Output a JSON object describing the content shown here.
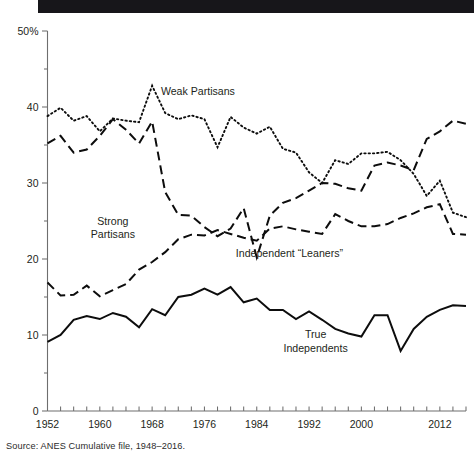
{
  "figure": {
    "top_band_label": "black-header-band",
    "source": "Source: ANES Cumulative file, 1948–2016."
  },
  "chart_data": {
    "type": "line",
    "title": "",
    "subtitle": "",
    "xlabel": "",
    "ylabel": "",
    "xlim": [
      1952,
      2016
    ],
    "ylim": [
      0,
      50
    ],
    "grid": false,
    "legend_position": "inline-annotations",
    "y_ticks": [
      0,
      10,
      20,
      30,
      40,
      50
    ],
    "y_tick_labels": [
      "0",
      "10",
      "20",
      "30",
      "40",
      "50%"
    ],
    "y_minor_ticks": [
      5,
      15,
      25,
      35,
      45
    ],
    "x_ticks": [
      1952,
      1954,
      1956,
      1958,
      1960,
      1962,
      1964,
      1966,
      1968,
      1970,
      1972,
      1974,
      1976,
      1978,
      1980,
      1982,
      1984,
      1986,
      1988,
      1990,
      1992,
      1994,
      1996,
      1998,
      2000,
      2002,
      2004,
      2006,
      2008,
      2010,
      2012,
      2014,
      2016
    ],
    "x_tick_labels": [
      "1952",
      "1960",
      "1968",
      "1976",
      "1984",
      "1992",
      "2000",
      "2012"
    ],
    "x_labeled_ticks": [
      1952,
      1960,
      1968,
      1976,
      1984,
      1992,
      2000,
      2012
    ],
    "x": [
      1952,
      1954,
      1956,
      1958,
      1960,
      1962,
      1964,
      1966,
      1968,
      1970,
      1972,
      1974,
      1976,
      1978,
      1980,
      1982,
      1984,
      1986,
      1988,
      1990,
      1992,
      1994,
      1996,
      1998,
      2000,
      2002,
      2004,
      2006,
      2008,
      2010,
      2012,
      2014,
      2016
    ],
    "series": [
      {
        "name": "Weak Partisans",
        "style": "dotted",
        "label_x": 1975,
        "label_y": 41.6,
        "values": [
          38.8,
          39.9,
          38.2,
          38.8,
          36.8,
          38.5,
          38.2,
          38.0,
          42.8,
          39.2,
          38.4,
          38.9,
          38.4,
          34.7,
          38.7,
          37.3,
          36.5,
          37.4,
          34.5,
          34.0,
          31.4,
          30.0,
          33.0,
          32.5,
          33.9,
          33.9,
          34.1,
          33.0,
          31.2,
          28.3,
          30.3,
          26.1,
          25.5
        ]
      },
      {
        "name": "Strong Partisans",
        "style": "dashed",
        "label_x": 1962,
        "label_y": 24.5,
        "label_lines": [
          "Strong",
          "Partisans"
        ],
        "values": [
          35.2,
          36.2,
          34.0,
          34.4,
          36.2,
          38.4,
          37.0,
          35.2,
          38.1,
          28.8,
          25.8,
          25.7,
          24.2,
          23.0,
          24.0,
          26.7,
          20.2,
          25.7,
          27.4,
          28.0,
          29.0,
          30.0,
          29.9,
          29.3,
          29.0,
          32.3,
          32.7,
          32.3,
          31.7,
          35.8,
          36.8,
          38.2,
          37.8
        ]
      },
      {
        "name": "Independent “Leaners”",
        "style": "dashed",
        "label_x": 1989,
        "label_y": 20.2,
        "values": [
          16.9,
          15.2,
          15.3,
          16.5,
          15.1,
          15.9,
          16.7,
          18.6,
          19.6,
          20.9,
          22.6,
          23.2,
          23.1,
          23.8,
          23.3,
          22.8,
          22.4,
          24.0,
          24.3,
          23.9,
          23.6,
          23.3,
          25.9,
          25.0,
          24.3,
          24.3,
          24.6,
          25.4,
          26.0,
          26.8,
          27.2,
          23.3,
          23.2
        ]
      },
      {
        "name": "True Independents",
        "style": "solid",
        "label_x": 1993,
        "label_y": 9.6,
        "label_lines": [
          "True",
          "Independents"
        ],
        "values": [
          9.1,
          10.0,
          12.0,
          12.5,
          12.1,
          12.9,
          12.4,
          11.0,
          13.4,
          12.6,
          15.0,
          15.3,
          16.1,
          15.3,
          16.3,
          14.3,
          14.8,
          13.3,
          13.3,
          12.1,
          13.1,
          12.0,
          10.8,
          10.2,
          9.8,
          12.6,
          12.6,
          7.9,
          10.8,
          12.4,
          13.3,
          13.9,
          13.8
        ]
      }
    ]
  }
}
